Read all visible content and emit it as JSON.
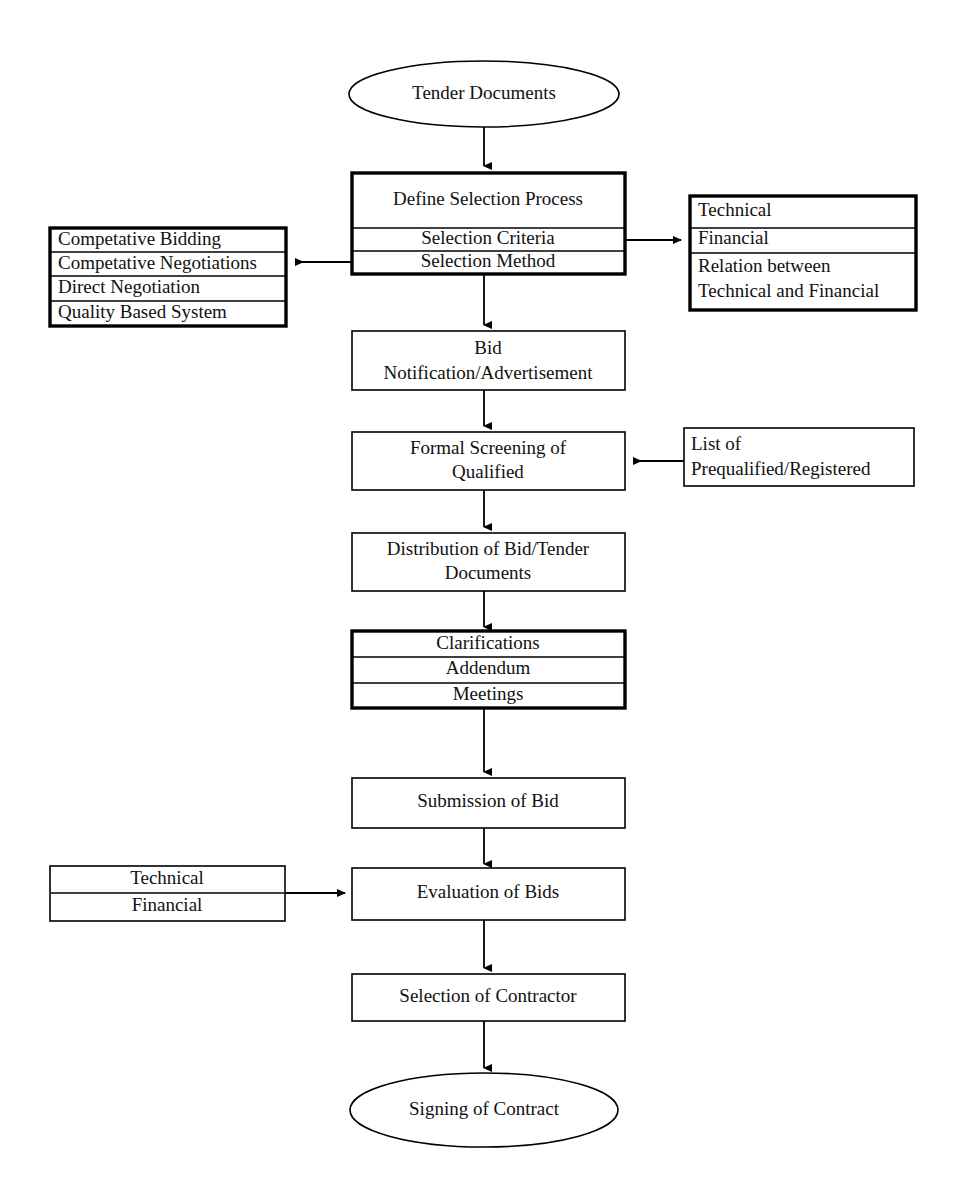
{
  "document": {
    "title": "Tender Documents Selection Process Flowchart",
    "background_color": "#ffffff",
    "line_color": "#000000",
    "text_color": "#111111"
  },
  "nodes": {
    "start": {
      "label": "Tender  Documents",
      "shape": "ellipse",
      "border": "thin"
    },
    "define_selection": {
      "shape": "rect",
      "border": "thick",
      "rows": [
        "Define Selection Process",
        "Selection Criteria",
        "Selection Method"
      ]
    },
    "selection_methods": {
      "shape": "rect",
      "border": "thick",
      "align": "left",
      "rows": [
        "Competative Bidding",
        "Competative Negotiations",
        "Direct Negotiation",
        "Quality Based System"
      ]
    },
    "selection_criteria": {
      "shape": "rect",
      "border": "thick",
      "align": "left",
      "rows": [
        "Technical",
        "Financial",
        "Relation between\nTechnical and Financial"
      ]
    },
    "bid_notification": {
      "shape": "rect",
      "border": "thin",
      "rows": [
        "Bid\nNotification/Advertisement"
      ]
    },
    "formal_screening": {
      "shape": "rect",
      "border": "thin",
      "rows": [
        "Formal Screening of\nQualified"
      ]
    },
    "prequalified_list": {
      "shape": "rect",
      "border": "thin",
      "align": "left",
      "rows": [
        "List of\nPrequalified/Registered"
      ]
    },
    "distribution": {
      "shape": "rect",
      "border": "thin",
      "rows": [
        "Distribution of Bid/Tender\nDocuments"
      ]
    },
    "clarifications": {
      "shape": "rect",
      "border": "thick",
      "rows": [
        "Clarifications",
        "Addendum",
        "Meetings"
      ]
    },
    "submission": {
      "shape": "rect",
      "border": "thin",
      "rows": [
        "Submission of Bid"
      ]
    },
    "evaluation_inputs": {
      "shape": "rect",
      "border": "thin",
      "rows": [
        "Technical",
        "Financial"
      ]
    },
    "evaluation": {
      "shape": "rect",
      "border": "thin",
      "rows": [
        "Evaluation of Bids"
      ]
    },
    "selection_contractor": {
      "shape": "rect",
      "border": "thin",
      "rows": [
        "Selection of Contractor"
      ]
    },
    "end": {
      "label": "Signing of Contract",
      "shape": "ellipse",
      "border": "thin"
    }
  },
  "flow_sequence": [
    "Tender  Documents",
    "Define Selection Process",
    "Bid Notification/Advertisement",
    "Formal Screening of Qualified",
    "Distribution of Bid/Tender Documents",
    "Clarifications",
    "Submission of Bid",
    "Evaluation of Bids",
    "Selection of Contractor",
    "Signing of Contract"
  ]
}
